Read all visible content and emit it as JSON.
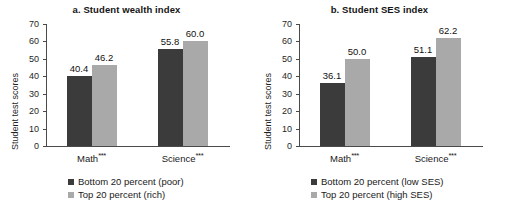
{
  "figure": {
    "ylabel": "Student test scores",
    "colors": {
      "dark": "#3b3b3b",
      "light": "#a9a9a9",
      "axis": "#4a4a4a",
      "text": "#1a1a1a",
      "background": "#ffffff"
    },
    "yticks": [
      "0",
      "10",
      "20",
      "30",
      "40",
      "50",
      "60",
      "70"
    ]
  },
  "chart_data": [
    {
      "type": "bar",
      "title": "a. Student wealth index",
      "xlabel": "",
      "ylabel": "Student test scores",
      "ylim": [
        0,
        70
      ],
      "ytick_values": [
        0,
        10,
        20,
        30,
        40,
        50,
        60,
        70
      ],
      "grid": false,
      "legend_position": "bottom-center",
      "categories": [
        "Math",
        "Science"
      ],
      "category_labels": [
        "Math***",
        "Science***"
      ],
      "category_significance": [
        "***",
        "***"
      ],
      "series": [
        {
          "name": "Bottom 20 percent (poor)",
          "color": "#3b3b3b",
          "values": [
            40.4,
            55.8
          ],
          "value_labels": [
            "40.4",
            "55.8"
          ]
        },
        {
          "name": "Top 20 percent (rich)",
          "color": "#a9a9a9",
          "values": [
            46.2,
            60.0
          ],
          "value_labels": [
            "46.2",
            "60.0"
          ]
        }
      ]
    },
    {
      "type": "bar",
      "title": "b. Student SES index",
      "xlabel": "",
      "ylabel": "Student test scores",
      "ylim": [
        0,
        70
      ],
      "ytick_values": [
        0,
        10,
        20,
        30,
        40,
        50,
        60,
        70
      ],
      "grid": false,
      "legend_position": "bottom-center",
      "categories": [
        "Math",
        "Science"
      ],
      "category_labels": [
        "Math***",
        "Science***"
      ],
      "category_significance": [
        "***",
        "***"
      ],
      "series": [
        {
          "name": "Bottom 20 percent (low SES)",
          "color": "#3b3b3b",
          "values": [
            36.1,
            51.1
          ],
          "value_labels": [
            "36.1",
            "51.1"
          ]
        },
        {
          "name": "Top 20 percent (high SES)",
          "color": "#a9a9a9",
          "values": [
            50.0,
            62.2
          ],
          "value_labels": [
            "50.0",
            "62.2"
          ]
        }
      ]
    }
  ]
}
